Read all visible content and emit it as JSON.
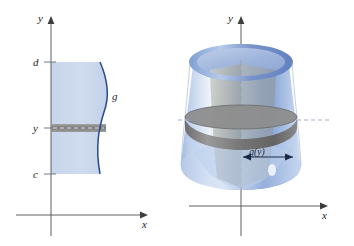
{
  "figure": {
    "background_color": "#ffffff"
  },
  "colors": {
    "region_fill": "#ccd8ec",
    "curve_stroke": "#2b4a8b",
    "axis_stroke": "#595959",
    "strip_fill": "#8e8e8e",
    "strip_stroke": "#5a5a5a",
    "shell_band": "#7c7c7c",
    "solid_blue_light": "#e4ebf7",
    "solid_blue_mid": "#aec3e4",
    "solid_blue_dark": "#6f8fcc",
    "cut_face_gray": "#b9bcc0",
    "dashed_axis": "#9aa3ae",
    "text": "#1b1b1b"
  },
  "left_panel": {
    "name": "plane-region-panel",
    "y_axis_label": "y",
    "x_axis_label": "x",
    "tick_labels": {
      "upper_bound": "d",
      "sample_height": "y",
      "lower_bound": "c"
    },
    "curve_label": "g",
    "description": "Region bounded on the right by the curve x = g(y) between y = c and y = d, with a representative horizontal rectangle at height y"
  },
  "right_panel": {
    "name": "solid-of-revolution-panel",
    "y_axis_label": "y",
    "x_axis_label": "x",
    "measure_label": "g(y)",
    "description": "Solid generated by revolving the region about the y-axis, with a representative cylindrical shell of radius g(y)"
  }
}
